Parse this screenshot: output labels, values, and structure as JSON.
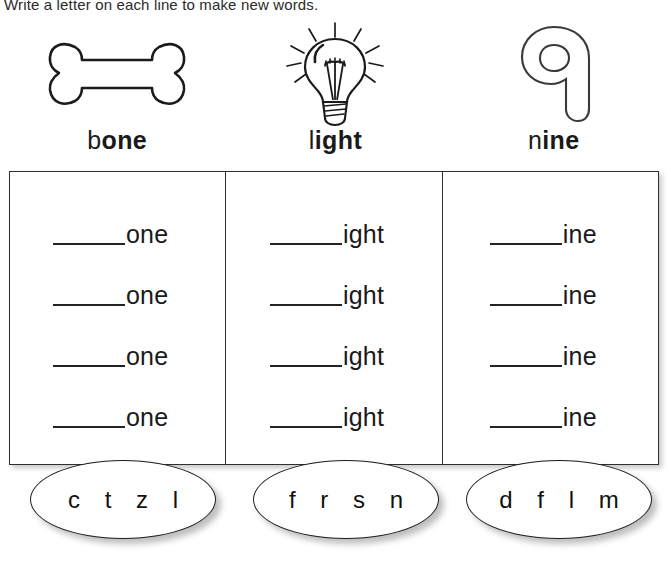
{
  "instruction": "Write a letter on each line to make new words.",
  "columns": [
    {
      "icon": "bone-outline-icon",
      "word": {
        "onset": "b",
        "rime": "one"
      },
      "rime_text": "one",
      "rows": [
        "one",
        "one",
        "one",
        "one"
      ],
      "letter_bank": "c  t  z  l"
    },
    {
      "icon": "light-bulb-icon",
      "word": {
        "onset": "l",
        "rime": "ight"
      },
      "rime_text": "ight",
      "rows": [
        "ight",
        "ight",
        "ight",
        "ight"
      ],
      "letter_bank": "f  r  s  n"
    },
    {
      "icon": "numeral-nine-outline-icon",
      "word": {
        "onset": "n",
        "rime": "ine"
      },
      "rime_text": "ine",
      "rows": [
        "ine",
        "ine",
        "ine",
        "ine"
      ],
      "letter_bank": "d  f  l  m"
    }
  ],
  "colors": {
    "ink": "#1a1a1a",
    "rule": "#232323",
    "border": "#2f2f2f",
    "paper": "#ffffff"
  }
}
